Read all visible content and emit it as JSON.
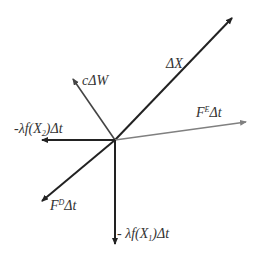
{
  "diagram": {
    "type": "vector-diagram",
    "colors": {
      "dark": "#222222",
      "gray": "#808080",
      "text": "#333333"
    },
    "vectors": [
      {
        "id": "delta-x",
        "label": "ΔX",
        "color": "#222222"
      },
      {
        "id": "c-delta-w",
        "label": "cΔW",
        "color": "#444444"
      },
      {
        "id": "fe-delta-t",
        "label_main": "F",
        "label_sup": "E",
        "label_tail": "Δt",
        "color": "#808080"
      },
      {
        "id": "lambda-fx2",
        "label_pre": "-λf(X",
        "label_sub": "2",
        "label_post": ")Δt",
        "color": "#222222"
      },
      {
        "id": "fd-delta-t",
        "label_main": "F",
        "label_sup": "D",
        "label_tail": "Δt",
        "color": "#222222"
      },
      {
        "id": "lambda-fx1",
        "label_pre": "- λf(X",
        "label_sub": "1",
        "label_post": ")Δt",
        "color": "#222222"
      }
    ]
  }
}
